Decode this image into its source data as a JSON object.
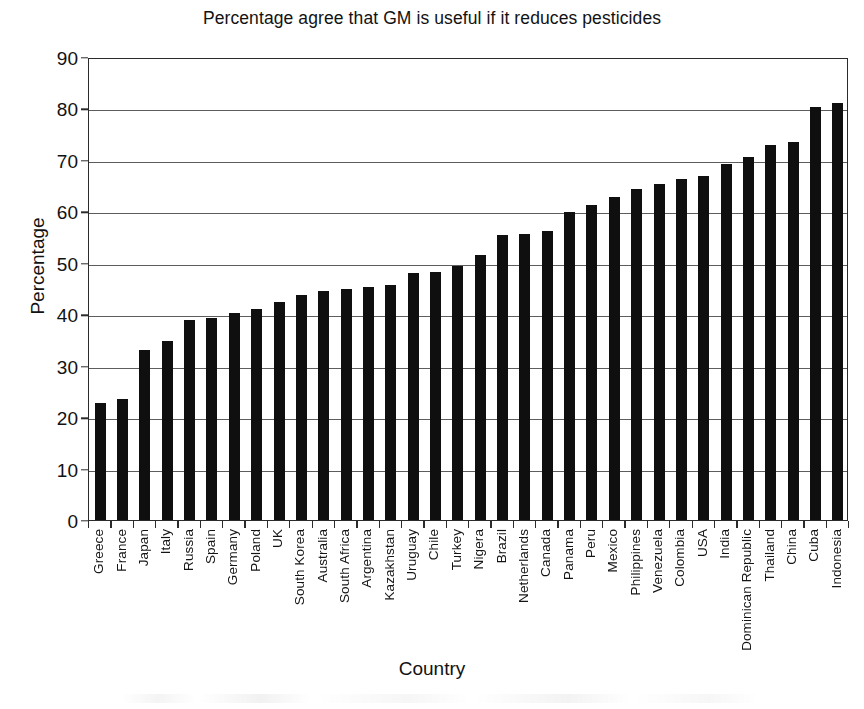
{
  "chart_data": {
    "type": "bar",
    "title": "Percentage agree that GM is useful if it reduces pesticides",
    "xlabel": "Country",
    "ylabel": "Percentage",
    "ylim": [
      0,
      90
    ],
    "ytick_step": 10,
    "yticks": [
      0,
      10,
      20,
      30,
      40,
      50,
      60,
      70,
      80,
      90
    ],
    "grid": "horizontal",
    "legend": "none",
    "bar_color": "#100f0f",
    "categories": [
      "Greece",
      "France",
      "Japan",
      "Italy",
      "Russia",
      "Spain",
      "Germany",
      "Poland",
      "UK",
      "South Korea",
      "Australia",
      "South Africa",
      "Argentina",
      "Kazakhstan",
      "Uruguay",
      "Chile",
      "Turkey",
      "Nigera",
      "Brazil",
      "Netherlands",
      "Canada",
      "Panama",
      "Peru",
      "Mexico",
      "Philippines",
      "Venezuela",
      "Colombia",
      "USA",
      "India",
      "Dominican Republic",
      "Thailand",
      "China",
      "Cuba",
      "Indonesia"
    ],
    "values": [
      22.8,
      23.6,
      33.0,
      34.8,
      38.9,
      39.3,
      40.2,
      41.0,
      42.4,
      43.8,
      44.6,
      45.0,
      45.3,
      45.7,
      48.0,
      48.2,
      49.3,
      51.5,
      55.4,
      55.5,
      56.2,
      59.8,
      61.3,
      62.8,
      64.4,
      65.3,
      66.2,
      66.8,
      69.2,
      70.6,
      72.9,
      73.4,
      80.3,
      81.0
    ]
  }
}
